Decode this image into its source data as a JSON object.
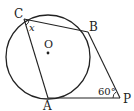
{
  "diagram": {
    "type": "circle-tangent-geometry",
    "circle": {
      "center_label": "O"
    },
    "points": {
      "C": "C",
      "B": "B",
      "A": "A",
      "P": "P"
    },
    "angles": {
      "at_C": "x",
      "at_P": "60°"
    },
    "colors": {
      "stroke": "#222222",
      "background": "#ffffff"
    }
  }
}
